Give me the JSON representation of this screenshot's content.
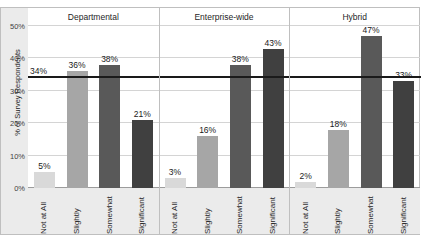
{
  "chart_data": {
    "type": "bar",
    "title": "",
    "xlabel": "",
    "ylabel": "% of Survey Respondents",
    "ylim": [
      0,
      50
    ],
    "ytick_labels": [
      "0%",
      "10%",
      "20%",
      "30%",
      "40%",
      "50%"
    ],
    "ytick_values": [
      0,
      10,
      20,
      30,
      40,
      50
    ],
    "grid": true,
    "legend": "none",
    "group_axis_label": "",
    "groups": [
      "Departmental",
      "Enterprise-wide",
      "Hybrid"
    ],
    "categories": [
      "Not at All",
      "Slightly",
      "Somewhat",
      "Significant"
    ],
    "series": [
      {
        "name": "Departmental",
        "values": [
          5,
          36,
          38,
          21
        ]
      },
      {
        "name": "Enterprise-wide",
        "values": [
          3,
          16,
          38,
          43
        ]
      },
      {
        "name": "Hybrid",
        "values": [
          2,
          18,
          47,
          33
        ]
      }
    ],
    "value_labels": [
      [
        "5%",
        "36%",
        "38%",
        "21%"
      ],
      [
        "3%",
        "16%",
        "38%",
        "43%"
      ],
      [
        "2%",
        "18%",
        "47%",
        "33%"
      ]
    ],
    "reference_line": {
      "label": "34%",
      "value": 34,
      "color": "#1a1a1a"
    },
    "bar_colors": [
      "#d9d9d9",
      "#a6a6a6",
      "#595959",
      "#404040"
    ]
  }
}
